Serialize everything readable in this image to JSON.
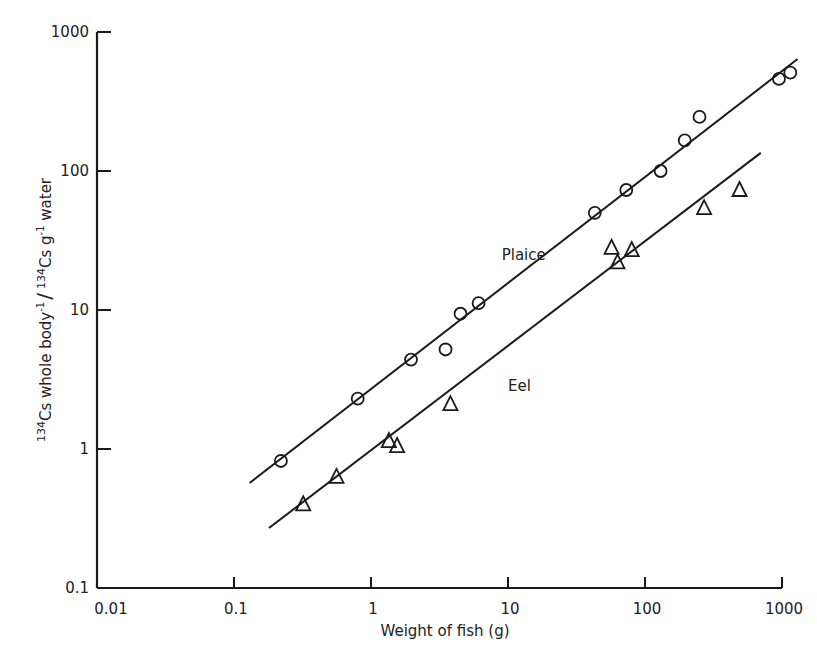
{
  "chart_data": {
    "type": "scatter",
    "title": "",
    "xlabel": "Weight of fish (g)",
    "ylabel": "134Cs whole body-1 / 134Cs g-1 water",
    "ylabel_parts": {
      "iso1": "134",
      "text1": "Cs whole body",
      "sup1": "-1",
      "slash": "/",
      "iso2": "134",
      "text2": "Cs g",
      "sup2": "-1",
      "text3": " water"
    },
    "xscale": "log",
    "yscale": "log",
    "xlim": [
      0.01,
      1000
    ],
    "ylim": [
      0.1,
      1000
    ],
    "x_ticks": [
      "0.01",
      "0.1",
      "1",
      "10",
      "100",
      "1000"
    ],
    "y_ticks": [
      "0.1",
      "1",
      "10",
      "100",
      "1000"
    ],
    "grid": false,
    "legend": "none (inline labels)",
    "series": [
      {
        "name": "Plaice",
        "marker": "circle",
        "points": [
          [
            0.22,
            0.82
          ],
          [
            0.8,
            2.3
          ],
          [
            1.96,
            4.4
          ],
          [
            3.5,
            5.2
          ],
          [
            4.5,
            9.4
          ],
          [
            6.1,
            11.2
          ],
          [
            43,
            50
          ],
          [
            73,
            73
          ],
          [
            130,
            100
          ],
          [
            195,
            166
          ],
          [
            250,
            245
          ],
          [
            950,
            460
          ],
          [
            1150,
            510
          ]
        ],
        "fit_line": [
          [
            0.13,
            0.57
          ],
          [
            1300,
            640
          ]
        ]
      },
      {
        "name": "Eel",
        "marker": "triangle",
        "points": [
          [
            0.32,
            0.4
          ],
          [
            0.56,
            0.63
          ],
          [
            1.35,
            1.14
          ],
          [
            1.55,
            1.05
          ],
          [
            3.8,
            2.1
          ],
          [
            57,
            28
          ],
          [
            63,
            22
          ],
          [
            80,
            27
          ],
          [
            270,
            54
          ],
          [
            490,
            73
          ]
        ],
        "fit_line": [
          [
            0.18,
            0.27
          ],
          [
            700,
            135
          ]
        ]
      }
    ],
    "annotations": [
      {
        "text": "Plaice",
        "x": 9,
        "y": 23
      },
      {
        "text": "Eel",
        "x": 10,
        "y": 2.6
      }
    ]
  }
}
